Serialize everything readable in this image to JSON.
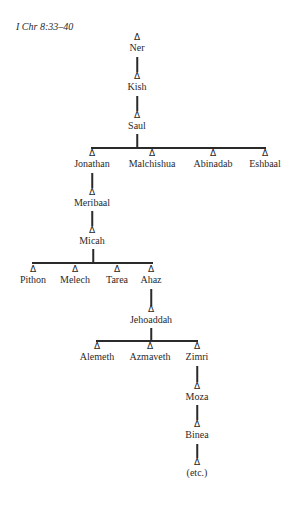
{
  "title": "I Chr 8:33–40",
  "symbol": "Δ",
  "nodes": {
    "ner": "Ner",
    "kish": "Kish",
    "saul": "Saul",
    "jonathan": "Jonathan",
    "malchishua": "Malchishua",
    "abinadab": "Abinadab",
    "eshbaal": "Eshbaal",
    "meribaal": "Meribaal",
    "micah": "Micah",
    "pithon": "Pithon",
    "melech": "Melech",
    "tarea": "Tarea",
    "ahaz": "Ahaz",
    "jehoaddah": "Jehoaddah",
    "alemeth": "Alemeth",
    "azmaveth": "Azmaveth",
    "zimri": "Zimri",
    "moza": "Moza",
    "binea": "Binea",
    "etc": "(etc.)"
  },
  "tree": {
    "name": "Ner",
    "children": [
      {
        "name": "Kish",
        "children": [
          {
            "name": "Saul",
            "children": [
              {
                "name": "Jonathan",
                "children": [
                  {
                    "name": "Meribaal",
                    "children": [
                      {
                        "name": "Micah",
                        "children": [
                          {
                            "name": "Pithon"
                          },
                          {
                            "name": "Melech"
                          },
                          {
                            "name": "Tarea"
                          },
                          {
                            "name": "Ahaz",
                            "children": [
                              {
                                "name": "Jehoaddah",
                                "children": [
                                  {
                                    "name": "Alemeth"
                                  },
                                  {
                                    "name": "Azmaveth"
                                  },
                                  {
                                    "name": "Zimri",
                                    "children": [
                                      {
                                        "name": "Moza",
                                        "children": [
                                          {
                                            "name": "Binea",
                                            "children": [
                                              {
                                                "name": "(etc.)"
                                              }
                                            ]
                                          }
                                        ]
                                      }
                                    ]
                                  }
                                ]
                              }
                            ]
                          }
                        ]
                      }
                    ]
                  }
                ]
              },
              {
                "name": "Malchishua"
              },
              {
                "name": "Abinadab"
              },
              {
                "name": "Eshbaal"
              }
            ]
          }
        ]
      }
    ]
  }
}
